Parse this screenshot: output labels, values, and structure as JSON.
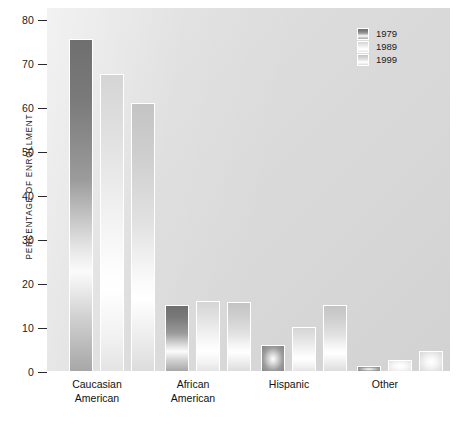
{
  "chart_data": {
    "type": "bar",
    "title": "",
    "xlabel": "",
    "ylabel": "PERCENTAGE OF ENROLLMENT",
    "ylim": [
      0,
      80
    ],
    "yticks": [
      0,
      10,
      20,
      30,
      40,
      50,
      60,
      70,
      80
    ],
    "grid": false,
    "legend_position": "top-right",
    "categories": [
      "Caucasian American",
      "African American",
      "Hispanic",
      "Other"
    ],
    "category_lines": [
      [
        "Caucasian",
        "American"
      ],
      [
        "African",
        "American"
      ],
      [
        "Hispanic",
        ""
      ],
      [
        "Other",
        ""
      ]
    ],
    "series": [
      {
        "name": "1979",
        "color": "#7d7d7d",
        "values": [
          76.0,
          15.5,
          6.3,
          1.6
        ]
      },
      {
        "name": "1989",
        "color": "#f4f4f4",
        "values": [
          68.0,
          16.3,
          10.6,
          3.1
        ]
      },
      {
        "name": "1999",
        "color": "#dcdcdc",
        "values": [
          61.5,
          16.2,
          15.6,
          5.0
        ]
      }
    ]
  },
  "legend": {
    "items": [
      {
        "label": "1979",
        "color": "#7d7d7d"
      },
      {
        "label": "1989",
        "color": "#f6f6f6"
      },
      {
        "label": "1999",
        "color": "#dcdcdc"
      }
    ]
  },
  "axis": {
    "y_label": "PERCENTAGE OF ENROLLMENT",
    "y_ticks": [
      "80",
      "70",
      "60",
      "50",
      "40",
      "30",
      "20",
      "10",
      "0"
    ]
  },
  "colors": {
    "panel_background": "#dcdcdc",
    "page_background": "#ffffff",
    "bar_border": "#ffffff",
    "text": "#1a1a1a"
  }
}
